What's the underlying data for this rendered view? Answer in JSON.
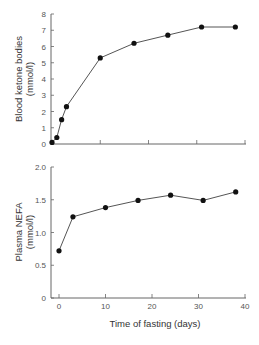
{
  "chart_data": [
    {
      "type": "line",
      "title": "",
      "xlabel": "Time of fasting (days)",
      "ylabel": "Blood ketone bodies (mmol/l)",
      "ylabel_lines": [
        "Blood ketone bodies",
        "(mmol/l)"
      ],
      "xlim": [
        0,
        40
      ],
      "ylim": [
        0,
        8
      ],
      "yticks": [
        "0",
        "1",
        "2",
        "3",
        "4",
        "5",
        "6",
        "7",
        "8"
      ],
      "xticks": [
        "",
        "",
        "",
        "",
        ""
      ],
      "x": [
        0,
        1,
        2,
        3,
        10,
        17,
        24,
        31,
        38
      ],
      "series": [
        {
          "name": "Blood ketone bodies",
          "values": [
            0.1,
            0.4,
            1.5,
            2.3,
            5.3,
            6.2,
            6.7,
            7.2,
            7.2
          ]
        }
      ],
      "grid": false,
      "legend": null
    },
    {
      "type": "line",
      "title": "",
      "xlabel": "Time of fasting (days)",
      "ylabel": "Plasma NEFA (mmol/l)",
      "ylabel_lines": [
        "Plasma NEFA",
        "(mmol/l)"
      ],
      "xlim": [
        0,
        40
      ],
      "ylim": [
        0,
        2.0
      ],
      "yticks": [
        "0",
        "0.5",
        "1.0",
        "1.5",
        "2.0"
      ],
      "xticks": [
        "0",
        "10",
        "20",
        "30",
        "40"
      ],
      "x": [
        0,
        3,
        10,
        17,
        24,
        31,
        38
      ],
      "series": [
        {
          "name": "Plasma NEFA",
          "values": [
            0.72,
            1.24,
            1.38,
            1.49,
            1.57,
            1.49,
            1.62
          ]
        }
      ],
      "grid": false,
      "legend": null
    }
  ],
  "style": {
    "line_color": "#555555",
    "marker_color": "#111111",
    "axis_color": "#666666"
  }
}
